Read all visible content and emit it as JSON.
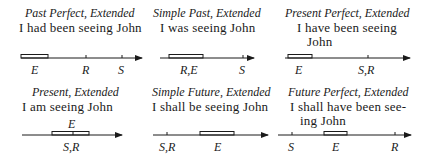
{
  "panels": [
    {
      "title": "Past Perfect, Extended",
      "sentence": [
        "I had been seeing John"
      ],
      "labels": {
        "E": "E",
        "R": "R",
        "S": "S"
      }
    },
    {
      "title": "Simple Past, Extended",
      "sentence": [
        "I was seeing John"
      ],
      "labels": {
        "RE": "R,E",
        "S": "S"
      }
    },
    {
      "title": "Present Perfect, Extended",
      "sentence": [
        "I have been seeing",
        "John"
      ],
      "labels": {
        "E": "E",
        "SR": "S,R"
      }
    },
    {
      "title": "Present, Extended",
      "sentence": [
        "I am seeing John"
      ],
      "labels": {
        "E": "E",
        "SR": "S,R"
      }
    },
    {
      "title": "Simple Future, Extended",
      "sentence": [
        "I shall be seeing John"
      ],
      "labels": {
        "SR": "S,R",
        "E": "E"
      }
    },
    {
      "title": "Future Perfect, Extended",
      "sentence": [
        "I shall have been see-",
        "ing John"
      ],
      "labels": {
        "S": "S",
        "E": "E",
        "R": "R"
      }
    }
  ],
  "colors": {
    "ink": "#1a1a1a",
    "background": "#ffffff"
  }
}
